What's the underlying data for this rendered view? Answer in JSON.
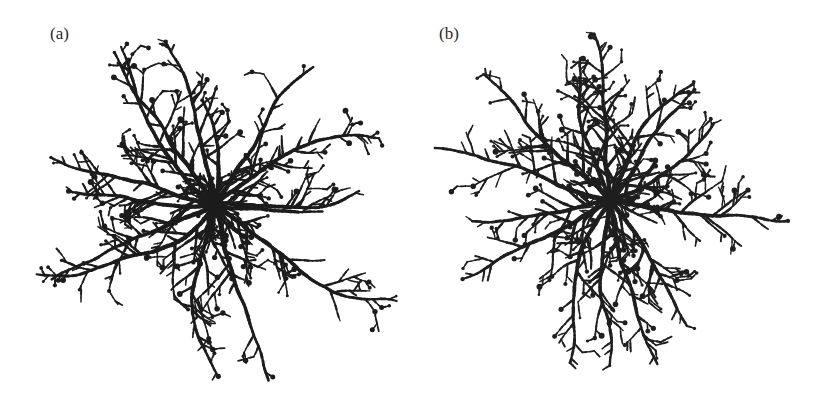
{
  "figure": {
    "panels": [
      {
        "label": "(a)",
        "center": [
          215,
          205
        ],
        "radius": 175,
        "seed": 11,
        "color": "#1c1c1c",
        "arms": [
          {
            "angle": -120,
            "len": 185
          },
          {
            "angle": -98,
            "len": 175
          },
          {
            "angle": -78,
            "len": 110
          },
          {
            "angle": -58,
            "len": 175
          },
          {
            "angle": -38,
            "len": 185
          },
          {
            "angle": -12,
            "len": 150
          },
          {
            "angle": 12,
            "len": 110
          },
          {
            "angle": 38,
            "len": 215
          },
          {
            "angle": 70,
            "len": 185
          },
          {
            "angle": 95,
            "len": 180
          },
          {
            "angle": 120,
            "len": 200
          },
          {
            "angle": 150,
            "len": 180
          },
          {
            "angle": 172,
            "len": 150
          },
          {
            "angle": -165,
            "len": 175
          },
          {
            "angle": -142,
            "len": 190
          }
        ]
      },
      {
        "label": "(b)",
        "center": [
          193,
          200
        ],
        "radius": 180,
        "seed": 29,
        "color": "#1f1f1f",
        "arms": [
          {
            "angle": -93,
            "len": 170
          },
          {
            "angle": -115,
            "len": 150
          },
          {
            "angle": -65,
            "len": 150
          },
          {
            "angle": -40,
            "len": 140
          },
          {
            "angle": -18,
            "len": 135
          },
          {
            "angle": 15,
            "len": 180
          },
          {
            "angle": 45,
            "len": 150
          },
          {
            "angle": 75,
            "len": 175
          },
          {
            "angle": 100,
            "len": 170
          },
          {
            "angle": 125,
            "len": 175
          },
          {
            "angle": 150,
            "len": 170
          },
          {
            "angle": 175,
            "len": 140
          },
          {
            "angle": -168,
            "len": 185
          },
          {
            "angle": -140,
            "len": 180
          }
        ]
      }
    ]
  }
}
